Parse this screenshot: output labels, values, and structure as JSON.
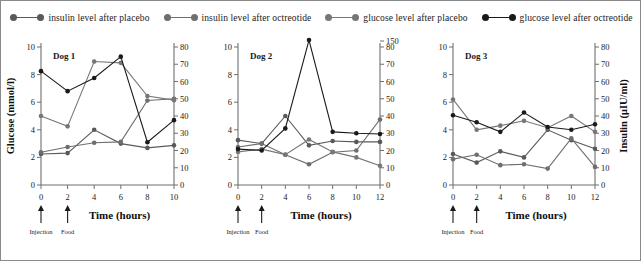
{
  "legend": {
    "entries": [
      {
        "label": "insulin level after placebo",
        "color": "#5a5a5a",
        "icon": "line-marker-icon"
      },
      {
        "label": "insulin level after octreotide",
        "color": "#6e6e6e",
        "icon": "line-marker-icon"
      },
      {
        "label": "glucose level after placebo",
        "color": "#777777",
        "icon": "line-marker-icon"
      },
      {
        "label": "glucose level after octreotide",
        "color": "#1a1a1a",
        "icon": "line-marker-icon"
      }
    ]
  },
  "axes": {
    "y_left_title": "Glucose (mmol/l)",
    "y_right_title": "Insulin (μIU/ml)",
    "x_title": "Time (hours)"
  },
  "events": {
    "injection": "Injection",
    "food": "Food"
  },
  "chart_data": [
    {
      "type": "line",
      "title": "Dog 1",
      "xlabel": "Time (hours)",
      "ylabel": "Glucose (mmol/l)",
      "y2label": "Insulin (μIU/ml)",
      "x": [
        0,
        2,
        4,
        6,
        8,
        10
      ],
      "xlim": [
        0,
        10
      ],
      "xticks": [
        0,
        2,
        4,
        6,
        8,
        10
      ],
      "ylim": [
        0,
        10
      ],
      "yticks": [
        0,
        2,
        4,
        6,
        8,
        10
      ],
      "y2lim": [
        0,
        80
      ],
      "y2ticks": [
        0,
        10,
        20,
        30,
        40,
        50,
        60,
        70,
        80
      ],
      "grid": false,
      "legend_position": "top-center",
      "annotations": [
        {
          "text": "Injection",
          "x": 0
        },
        {
          "text": "Food",
          "x": 2
        }
      ],
      "series": [
        {
          "name": "insulin level after placebo",
          "axis": "right",
          "color": "#5a5a5a",
          "values": [
            18,
            18.5,
            32,
            24,
            21.5,
            23
          ]
        },
        {
          "name": "insulin level after octreotide",
          "axis": "right",
          "color": "#6e6e6e",
          "values": [
            19,
            22,
            24.5,
            25,
            49,
            50
          ]
        },
        {
          "name": "glucose level after placebo",
          "axis": "left",
          "color": "#777777",
          "values": [
            5.0,
            4.25,
            8.95,
            8.85,
            6.45,
            6.15
          ]
        },
        {
          "name": "glucose level after octreotide",
          "axis": "left",
          "color": "#1a1a1a",
          "values": [
            8.25,
            6.8,
            7.75,
            9.3,
            3.1,
            4.7
          ]
        }
      ]
    },
    {
      "type": "line",
      "title": "Dog 2",
      "xlabel": "Time (hours)",
      "ylabel": "Glucose (mmol/l)",
      "y2label": "Insulin (μIU/ml)",
      "x": [
        0,
        2,
        4,
        6,
        8,
        10,
        12
      ],
      "xlim": [
        0,
        12
      ],
      "xticks": [
        0,
        2,
        4,
        6,
        8,
        10,
        12
      ],
      "ylim": [
        0,
        10
      ],
      "yticks": [
        0,
        2,
        4,
        6,
        8,
        10
      ],
      "y2lim": [
        0,
        80
      ],
      "y2ticks": [
        0,
        10,
        20,
        30,
        40,
        50,
        60,
        70,
        80
      ],
      "y2_offscale_label": "150",
      "grid": false,
      "legend_position": "top-center",
      "annotations": [
        {
          "text": "Injection",
          "x": 0
        },
        {
          "text": "Food",
          "x": 2
        }
      ],
      "series": [
        {
          "name": "insulin level after placebo",
          "axis": "right",
          "color": "#5a5a5a",
          "values": [
            26,
            24,
            40,
            23,
            25.5,
            25,
            25
          ]
        },
        {
          "name": "insulin level after octreotide",
          "axis": "right",
          "color": "#6e6e6e",
          "values": [
            22,
            24,
            17.5,
            12,
            19,
            20,
            38
          ]
        },
        {
          "name": "glucose level after placebo",
          "axis": "left",
          "color": "#777777",
          "values": [
            2.4,
            2.6,
            2.2,
            3.3,
            2.4,
            2.0,
            1.4
          ]
        },
        {
          "name": "glucose level after octreotide",
          "axis": "left",
          "color": "#1a1a1a",
          "values": [
            2.6,
            2.5,
            4.1,
            10.5,
            3.85,
            3.75,
            3.7
          ]
        }
      ]
    },
    {
      "type": "line",
      "title": "Dog 3",
      "xlabel": "Time (hours)",
      "ylabel": "Glucose (mmol/l)",
      "y2label": "Insulin (μIU/ml)",
      "x": [
        0,
        2,
        4,
        6,
        8,
        10,
        12
      ],
      "xlim": [
        0,
        12
      ],
      "xticks": [
        0,
        2,
        4,
        6,
        8,
        10,
        12
      ],
      "ylim": [
        0,
        10
      ],
      "yticks": [
        0,
        2,
        4,
        6,
        8,
        10
      ],
      "y2lim": [
        0,
        80
      ],
      "y2ticks": [
        0,
        10,
        20,
        30,
        40,
        50,
        60,
        70,
        80
      ],
      "grid": false,
      "legend_position": "top-center",
      "annotations": [
        {
          "text": "Injection",
          "x": 0
        },
        {
          "text": "Food",
          "x": 2
        }
      ],
      "series": [
        {
          "name": "insulin level after placebo",
          "axis": "right",
          "color": "#5a5a5a",
          "values": [
            18,
            13,
            19.5,
            16,
            32,
            26,
            21
          ]
        },
        {
          "name": "insulin level after octreotide",
          "axis": "right",
          "color": "#6e6e6e",
          "values": [
            15,
            17.5,
            11.5,
            12,
            9.5,
            27,
            10.5
          ]
        },
        {
          "name": "glucose level after placebo",
          "axis": "left",
          "color": "#777777",
          "values": [
            6.2,
            4.0,
            4.3,
            4.65,
            4.15,
            5.0,
            3.85
          ]
        },
        {
          "name": "glucose level after octreotide",
          "axis": "left",
          "color": "#1a1a1a",
          "values": [
            5.05,
            4.55,
            3.85,
            5.25,
            4.2,
            4.0,
            4.4
          ]
        }
      ]
    }
  ]
}
